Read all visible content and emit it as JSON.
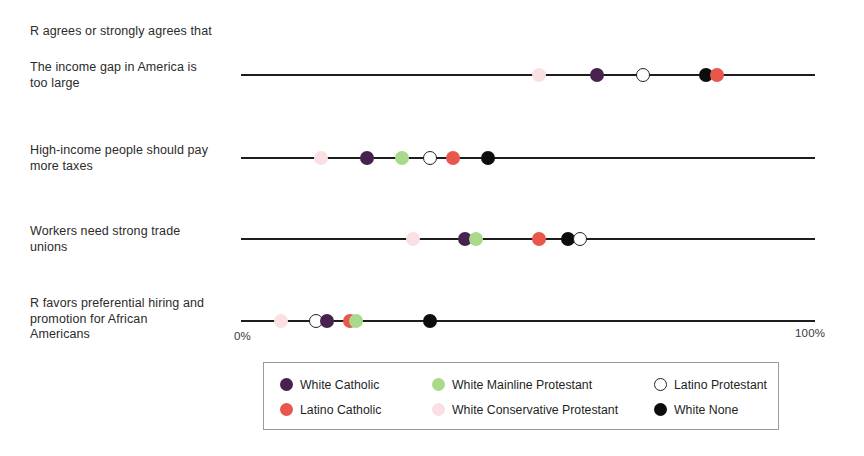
{
  "header": {
    "note": "R agrees or strongly agrees that"
  },
  "axis": {
    "left_tick": "0%",
    "right_tick": "100%",
    "min": 0,
    "max": 100
  },
  "legend": {
    "entries": [
      {
        "label": "White Catholic",
        "key": "white_catholic",
        "color": "#46224f",
        "style": "filled"
      },
      {
        "label": "White Mainline Protestant",
        "key": "white_mainline_protestant",
        "color": "#a9d98b",
        "style": "filled"
      },
      {
        "label": "Latino Protestant",
        "key": "latino_protestant",
        "color": "#ffffff",
        "style": "hollow"
      },
      {
        "label": "Latino Catholic",
        "key": "latino_catholic",
        "color": "#e8564c",
        "style": "filled"
      },
      {
        "label": "White Conservative Protestant",
        "key": "white_conservative_protestant",
        "color": "#fadfe3",
        "style": "filled"
      },
      {
        "label": "White None",
        "key": "white_none",
        "color": "#0d0d0d",
        "style": "filled"
      }
    ]
  },
  "chart_data": {
    "type": "scatter",
    "title": "R agrees or strongly agrees that",
    "xlabel": "",
    "ylabel": "",
    "xlim": [
      0,
      100
    ],
    "xticks": [
      0,
      100
    ],
    "xtick_labels": [
      "0%",
      "100%"
    ],
    "grid": false,
    "legend_position": "bottom",
    "categories": [
      "The income gap in America is too large",
      "High-income people should pay more taxes",
      "Workers need strong trade unions",
      "R favors preferential hiring and promotion for African Americans"
    ],
    "series": [
      {
        "name": "White Catholic",
        "color": "#46224f",
        "style": "filled",
        "values": [
          62,
          22,
          39,
          15
        ]
      },
      {
        "name": "White Mainline Protestant",
        "color": "#a9d98b",
        "style": "filled",
        "values": [
          null,
          28,
          41,
          20
        ]
      },
      {
        "name": "Latino Protestant",
        "color": "#ffffff",
        "style": "hollow",
        "values": [
          70,
          33,
          59,
          13
        ]
      },
      {
        "name": "Latino Catholic",
        "color": "#e8564c",
        "style": "filled",
        "values": [
          83,
          37,
          52,
          19
        ]
      },
      {
        "name": "White Conservative Protestant",
        "color": "#fadfe3",
        "style": "filled",
        "values": [
          52,
          14,
          30,
          7
        ]
      },
      {
        "name": "White None",
        "color": "#0d0d0d",
        "style": "filled",
        "values": [
          81,
          43,
          57,
          33
        ]
      }
    ],
    "rows": [
      {
        "label_lines": [
          "The income gap in America is",
          "too large"
        ],
        "points": [
          {
            "group": "White Conservative Protestant",
            "value": 52,
            "color": "#fadfe3",
            "style": "filled"
          },
          {
            "group": "White Catholic",
            "value": 62,
            "color": "#46224f",
            "style": "filled"
          },
          {
            "group": "Latino Protestant",
            "value": 70,
            "color": "#ffffff",
            "style": "hollow"
          },
          {
            "group": "White None",
            "value": 81,
            "color": "#0d0d0d",
            "style": "filled"
          },
          {
            "group": "Latino Catholic",
            "value": 83,
            "color": "#e8564c",
            "style": "filled"
          }
        ]
      },
      {
        "label_lines": [
          "High-income people should pay",
          "more taxes"
        ],
        "points": [
          {
            "group": "White Conservative Protestant",
            "value": 14,
            "color": "#fadfe3",
            "style": "filled"
          },
          {
            "group": "White Catholic",
            "value": 22,
            "color": "#46224f",
            "style": "filled"
          },
          {
            "group": "White Mainline Protestant",
            "value": 28,
            "color": "#a9d98b",
            "style": "filled"
          },
          {
            "group": "Latino Protestant",
            "value": 33,
            "color": "#ffffff",
            "style": "hollow"
          },
          {
            "group": "Latino Catholic",
            "value": 37,
            "color": "#e8564c",
            "style": "filled"
          },
          {
            "group": "White None",
            "value": 43,
            "color": "#0d0d0d",
            "style": "filled"
          }
        ]
      },
      {
        "label_lines": [
          "Workers need strong trade",
          "unions"
        ],
        "points": [
          {
            "group": "White Conservative Protestant",
            "value": 30,
            "color": "#fadfe3",
            "style": "filled"
          },
          {
            "group": "White Catholic",
            "value": 39,
            "color": "#46224f",
            "style": "filled"
          },
          {
            "group": "White Mainline Protestant",
            "value": 41,
            "color": "#a9d98b",
            "style": "filled"
          },
          {
            "group": "Latino Catholic",
            "value": 52,
            "color": "#e8564c",
            "style": "filled"
          },
          {
            "group": "White None",
            "value": 57,
            "color": "#0d0d0d",
            "style": "filled"
          },
          {
            "group": "Latino Protestant",
            "value": 59,
            "color": "#ffffff",
            "style": "hollow"
          }
        ]
      },
      {
        "label_lines": [
          "R favors preferential hiring and",
          "promotion for African",
          "Americans"
        ],
        "points": [
          {
            "group": "White Conservative Protestant",
            "value": 7,
            "color": "#fadfe3",
            "style": "filled"
          },
          {
            "group": "Latino Protestant",
            "value": 13,
            "color": "#ffffff",
            "style": "hollow"
          },
          {
            "group": "White Catholic",
            "value": 15,
            "color": "#46224f",
            "style": "filled"
          },
          {
            "group": "Latino Catholic",
            "value": 19,
            "color": "#e8564c",
            "style": "filled"
          },
          {
            "group": "White Mainline Protestant",
            "value": 20,
            "color": "#a9d98b",
            "style": "filled"
          },
          {
            "group": "White None",
            "value": 33,
            "color": "#0d0d0d",
            "style": "filled"
          }
        ]
      }
    ]
  }
}
